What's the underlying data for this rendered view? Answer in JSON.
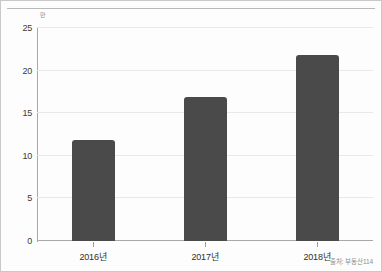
{
  "chart_data": {
    "type": "bar",
    "title": "",
    "subtitle": "",
    "categories": [
      "2016년",
      "2017년",
      "2018년"
    ],
    "values": [
      11.9,
      16.9,
      21.8
    ],
    "series": [
      {
        "name": "",
        "values": [
          11.9,
          16.9,
          21.8
        ]
      }
    ],
    "xlabel": "",
    "ylabel": "",
    "unit_label": "만",
    "ylim": [
      0,
      25
    ],
    "ytick_values": [
      0,
      5,
      10,
      15,
      20,
      25
    ],
    "ytick_labels": [
      "0",
      "5",
      "10",
      "15",
      "20",
      "25"
    ],
    "grid": true,
    "legend": false,
    "legend_position": "none",
    "annotations": [
      "출처: 부동산114"
    ],
    "bar_color": "#4a4a4a",
    "gridline_color": "#e8e8e8",
    "axis_color": "#a8a8a8"
  },
  "source": {
    "note": "출처: 부동산114"
  }
}
